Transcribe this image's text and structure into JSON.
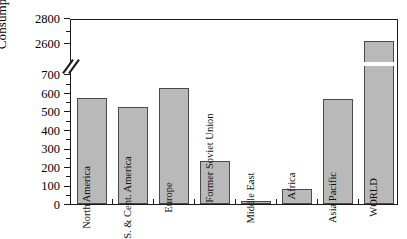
{
  "chart_data": {
    "type": "bar",
    "title": "",
    "xlabel": "",
    "ylabel": "Consumption (TWh)",
    "categories": [
      "North America",
      "S. & Cent. America",
      "Europe",
      "Former Soviet Union",
      "Middle East",
      "Africa",
      "Asia Pacific",
      "WORLD"
    ],
    "values": [
      570,
      520,
      625,
      232,
      15,
      80,
      565,
      2620
    ],
    "ylim": [
      0,
      2800
    ],
    "axis_break": {
      "present": true,
      "lower_max": 700,
      "upper_min": 2600
    },
    "yticks_lower": [
      0,
      100,
      200,
      300,
      400,
      500,
      600,
      700
    ],
    "yticks_upper": [
      2600,
      2800
    ],
    "ytick_labels": [
      "0",
      "100",
      "200",
      "300",
      "400",
      "500",
      "600",
      "700",
      "2600",
      "2800"
    ],
    "grid": false,
    "legend": null,
    "bar_fill_color": "#b9b9b9",
    "bar_edge_color": "#4a4a4a",
    "axis_color": "#1a1a1a",
    "background_color": "#ffffff"
  },
  "axis": {
    "y_label": "Consumption (TWh)",
    "ticks": [
      {
        "label": "2800"
      },
      {
        "label": "2600"
      },
      {
        "label": "700"
      },
      {
        "label": "600"
      },
      {
        "label": "500"
      },
      {
        "label": "400"
      },
      {
        "label": "300"
      },
      {
        "label": "200"
      },
      {
        "label": "100"
      },
      {
        "label": "0"
      }
    ]
  },
  "bars": [
    {
      "label": "North America",
      "value": 570
    },
    {
      "label": "S. & Cent. America",
      "value": 520
    },
    {
      "label": "Europe",
      "value": 625
    },
    {
      "label": "Former Soviet Union",
      "value": 232
    },
    {
      "label": "Middle East",
      "value": 15
    },
    {
      "label": "Africa",
      "value": 80
    },
    {
      "label": "Asia Pacific",
      "value": 565
    },
    {
      "label": "WORLD",
      "value": 2620
    }
  ]
}
